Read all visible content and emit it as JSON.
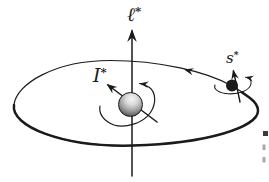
{
  "figure": {
    "colors": {
      "bg": "#ffffff",
      "ink": "#1b1b1b",
      "sphere-light": "#f4f4f4",
      "sphere-mid": "#9a9a9a",
      "sphere-dark": "#2e2e2e",
      "artifact-dark": "#3a3a3a",
      "artifact-light": "#a9a9a9"
    },
    "labels": {
      "orbit_axis": {
        "base": "ℓ",
        "star": "*"
      },
      "central_spin": {
        "base": "I",
        "star": "*"
      },
      "satellite_spin": {
        "base": "s",
        "star": "*"
      }
    },
    "icons": {
      "orbit_axis_arrowhead": "up-arrowhead",
      "orbit_direction_arrowhead": "left-arrowhead",
      "central_spin_arrowhead": "up-left-arrowhead",
      "central_precession_arrowhead": "left-arrowhead",
      "satellite_axis_arrowhead": "up-arrowhead",
      "satellite_precession_arrowhead": "left-arrowhead"
    }
  }
}
